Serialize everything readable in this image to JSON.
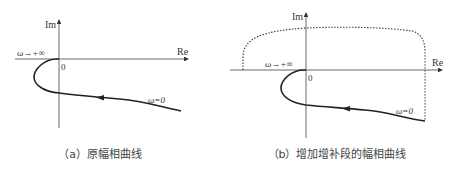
{
  "panels": [
    {
      "id": "a",
      "caption": "（a）原幅相曲线",
      "axes": {
        "x_label": "Re",
        "y_label": "Im",
        "origin_label": "0"
      },
      "annotations": {
        "high_freq": "ω→+∞",
        "low_freq": "ω=0"
      },
      "curves": [
        {
          "name": "original-nyquist",
          "style": "solid",
          "direction_arrow": "toward origin"
        }
      ]
    },
    {
      "id": "b",
      "caption": "（b）增加增补段的幅相曲线",
      "axes": {
        "x_label": "Re",
        "y_label": "Im",
        "origin_label": "0"
      },
      "annotations": {
        "high_freq": "ω→+∞",
        "low_freq": "ω=0"
      },
      "curves": [
        {
          "name": "original-nyquist",
          "style": "solid",
          "direction_arrow": "toward origin"
        },
        {
          "name": "supplementary-segment",
          "style": "dotted"
        }
      ]
    }
  ],
  "colors": {
    "line": "#222222",
    "text": "#333333",
    "background": "#ffffff"
  }
}
